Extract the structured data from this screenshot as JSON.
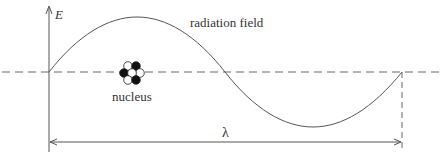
{
  "diagram": {
    "axis_label": "E",
    "wave_label": "radiation field",
    "nucleus_label": "nucleus",
    "wavelength_label": "λ",
    "colors": {
      "line": "#555555",
      "text": "#333333",
      "filled_nucleon": "#111111",
      "empty_nucleon": "#ffffff"
    },
    "nucleus": {
      "nucleons": [
        {
          "cx": 128,
          "cy": 66,
          "fill": "white"
        },
        {
          "cx": 136,
          "cy": 66,
          "fill": "black"
        },
        {
          "cx": 124,
          "cy": 73,
          "fill": "black"
        },
        {
          "cx": 132,
          "cy": 73,
          "fill": "white"
        },
        {
          "cx": 140,
          "cy": 73,
          "fill": "white"
        },
        {
          "cx": 128,
          "cy": 80,
          "fill": "white"
        },
        {
          "cx": 136,
          "cy": 80,
          "fill": "black"
        }
      ]
    }
  }
}
